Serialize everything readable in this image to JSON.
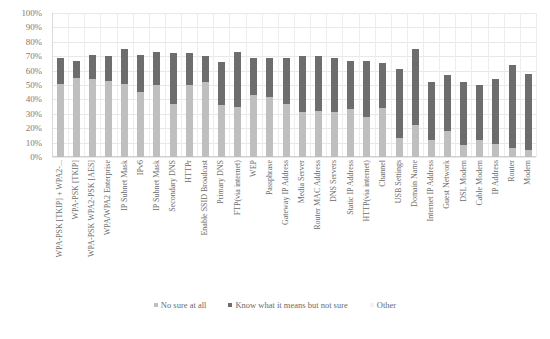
{
  "chart_data": {
    "type": "bar",
    "subtype": "stacked-column",
    "title": "",
    "xlabel": "",
    "ylabel": "",
    "ylim": [
      0,
      100
    ],
    "y_tick_labels": [
      "100%",
      "90%",
      "80%",
      "70%",
      "60%",
      "50%",
      "40%",
      "30%",
      "20%",
      "10%",
      "0%"
    ],
    "y_tick_values": [
      100,
      90,
      80,
      70,
      60,
      50,
      40,
      30,
      20,
      10,
      0
    ],
    "grid": true,
    "legend_position": "bottom",
    "categories": [
      "WPA-PSK [TKIP] + WPA2-...",
      "WPA-PSK [TKIP]",
      "WPA-PSK WPA2-PSK [AES]",
      "WPA/WPA2 Enterprise",
      "IP Subnet Mask",
      "IPv6",
      "IP Subnet Mask",
      "Secondary DNS",
      "HTTPr",
      "Enable SSID Broadcast",
      "Primary DNS",
      "FTP(via internet)",
      "WEP",
      "Passphrase",
      "Gateway IP Address",
      "Media Server",
      "Router MAC Address",
      "DNS Servers",
      "Static IP Address",
      "HTTP(via internet)",
      "Channel",
      "USB Settings",
      "Domain Name",
      "Internet IP Address",
      "Guest Network",
      "DSL Modem",
      "Cable Modem",
      "IP Address",
      "Router",
      "Modem"
    ],
    "series": [
      {
        "name": "No sure at all",
        "color": "#bfbfbf",
        "values": [
          51,
          55,
          54,
          53,
          51,
          45,
          50,
          37,
          50,
          52,
          36,
          35,
          43,
          42,
          37,
          31,
          32,
          31,
          33,
          28,
          34,
          13,
          22,
          12,
          18,
          8,
          12,
          9,
          6,
          5
        ]
      },
      {
        "name": "Know what it means but not sure",
        "color": "#6d6d6d",
        "values": [
          18,
          12,
          17,
          17,
          24,
          26,
          23,
          35,
          22,
          18,
          30,
          38,
          26,
          27,
          32,
          39,
          38,
          38,
          34,
          39,
          31,
          48,
          53,
          40,
          39,
          44,
          38,
          45,
          58,
          53
        ]
      }
    ],
    "legend": [
      {
        "label": "No sure at all",
        "color": "#bfbfbf"
      },
      {
        "label": "Know what it means but not sure",
        "color": "#6d6d6d"
      },
      {
        "label": "Other",
        "color": "#f2f2f2"
      }
    ]
  }
}
